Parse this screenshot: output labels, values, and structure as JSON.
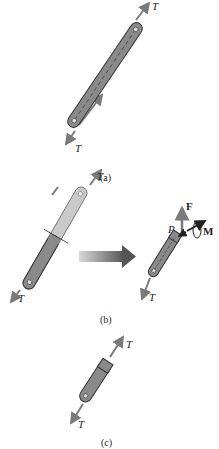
{
  "figure": {
    "panels": [
      {
        "id": "a",
        "caption": "(a)",
        "labels": {
          "top_force": "T",
          "bottom_force": "T"
        }
      },
      {
        "id": "b",
        "caption": "(b)",
        "labels": {
          "top_force": "T",
          "bottom_force": "T",
          "right_bottom_force": "T",
          "point": "P",
          "force": "F",
          "moment": "M"
        }
      },
      {
        "id": "c",
        "caption": "(c)",
        "labels": {
          "top_force": "T",
          "bottom_force": "T"
        }
      }
    ]
  },
  "colors": {
    "member_fill": "#8a8a8a",
    "member_light": "#c9c9c9",
    "arrow": "#7a7a7a",
    "outline": "#333333",
    "text": "#222222"
  }
}
